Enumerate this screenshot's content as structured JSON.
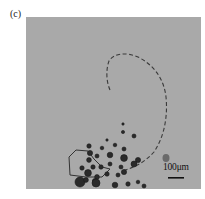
{
  "figure": {
    "panel_label": "(c)",
    "scale_bar": {
      "label": "100μm",
      "color": "#111111"
    },
    "background_color": "#a9a9a9",
    "trajectory": {
      "style": "dashed",
      "color": "#333333"
    },
    "particle_color": "#2a2a2a",
    "highlight_particle_color": "#6a6a6a"
  }
}
